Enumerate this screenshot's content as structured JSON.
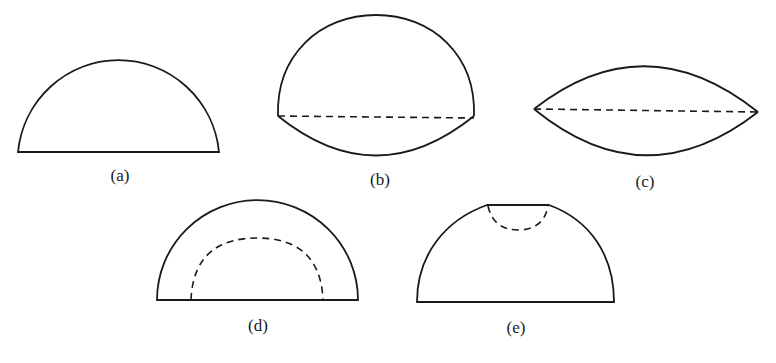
{
  "figure": {
    "panels": [
      {
        "id": "a",
        "label": "(a)",
        "description": "Semicircle (half-disc) with flat base"
      },
      {
        "id": "b",
        "label": "(b)",
        "description": "Large cap above dashed chord with shallow cap below"
      },
      {
        "id": "c",
        "label": "(c)",
        "description": "Lens shape: two symmetric arcs joined by dashed chord"
      },
      {
        "id": "d",
        "label": "(d)",
        "description": "Semicircle with smaller concentric dashed arc inside"
      },
      {
        "id": "e",
        "label": "(e)",
        "description": "Truncated dome with flat top and dashed small semicircular notch"
      }
    ],
    "colors": {
      "stroke": "#1a1a1a",
      "background": "#ffffff"
    }
  }
}
